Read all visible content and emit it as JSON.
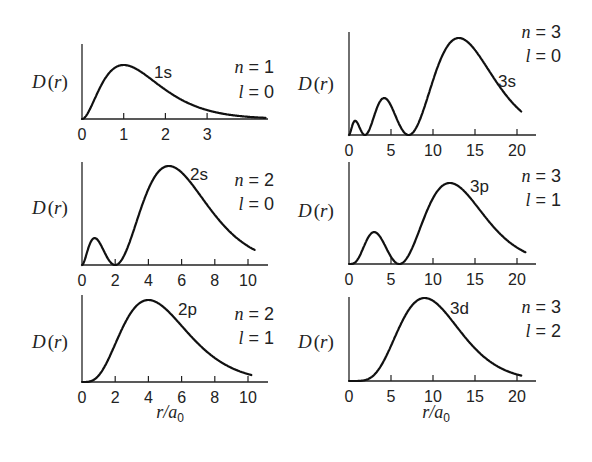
{
  "figure": {
    "ylabel": "D(r)",
    "xlabel": "r/a0"
  },
  "chart_data": [
    {
      "type": "line",
      "title": "1s",
      "quantum_numbers": {
        "n": 1,
        "l": 0
      },
      "xlabel": "",
      "ylabel": "D(r)",
      "xticks": [
        0,
        1,
        2,
        3
      ],
      "xlim": [
        0,
        4.4
      ],
      "function": "r^2 exp(-2r)",
      "peak_r": 1.0,
      "nodes": [],
      "x": [
        0,
        0.25,
        0.5,
        0.75,
        1,
        1.25,
        1.5,
        2,
        2.5,
        3,
        3.5,
        4,
        4.4
      ],
      "values": [
        0,
        0.41,
        0.74,
        0.91,
        1.0,
        0.95,
        0.84,
        0.59,
        0.34,
        0.22,
        0.11,
        0.05,
        0.02
      ]
    },
    {
      "type": "line",
      "title": "2s",
      "quantum_numbers": {
        "n": 2,
        "l": 0
      },
      "xlabel": "",
      "ylabel": "D(r)",
      "xticks": [
        0,
        2,
        4,
        6,
        8,
        10
      ],
      "xlim": [
        0,
        10.4
      ],
      "function": "r^2 (2-r)^2 exp(-r)",
      "peak_r": 5.24,
      "nodes": [
        2
      ],
      "x": [
        0,
        0.76,
        2,
        3,
        4,
        5.24,
        6,
        7,
        8,
        9,
        10.4
      ],
      "values": [
        0,
        0.26,
        0,
        0.46,
        0.84,
        1.0,
        0.93,
        0.76,
        0.54,
        0.37,
        0.16
      ]
    },
    {
      "type": "line",
      "title": "2p",
      "quantum_numbers": {
        "n": 2,
        "l": 1
      },
      "xlabel": "r/a0",
      "ylabel": "D(r)",
      "xticks": [
        0,
        2,
        4,
        6,
        8,
        10
      ],
      "xlim": [
        0,
        10.2
      ],
      "function": "r^4 exp(-r)",
      "peak_r": 4.0,
      "nodes": [],
      "x": [
        0,
        1,
        2,
        3,
        4,
        5,
        6,
        7,
        8,
        9,
        10.2
      ],
      "values": [
        0,
        0.08,
        0.52,
        0.94,
        1.0,
        0.86,
        0.64,
        0.43,
        0.26,
        0.15,
        0.07
      ]
    },
    {
      "type": "line",
      "title": "3s",
      "quantum_numbers": {
        "n": 3,
        "l": 0
      },
      "xlabel": "",
      "ylabel": "D(r)",
      "xticks": [
        0,
        5,
        10,
        15,
        20
      ],
      "xlim": [
        0,
        20.5
      ],
      "function": "r^2 (27-18r+2r^2)^2 exp(-2r/3)",
      "peak_r": 13.1,
      "nodes": [
        1.9,
        7.1
      ],
      "x": [
        0,
        0.74,
        1.9,
        4.19,
        7.1,
        10,
        13.1,
        16,
        18,
        20.5
      ],
      "values": [
        0,
        0.1,
        0,
        0.4,
        0,
        0.72,
        1.0,
        0.78,
        0.56,
        0.3
      ]
    },
    {
      "type": "line",
      "title": "3p",
      "quantum_numbers": {
        "n": 3,
        "l": 1
      },
      "xlabel": "",
      "ylabel": "D(r)",
      "xticks": [
        0,
        5,
        10,
        15,
        20
      ],
      "xlim": [
        0,
        21
      ],
      "function": "r^4 (6-r)^2 exp(-2r/3)",
      "peak_r": 12.0,
      "nodes": [
        6
      ],
      "x": [
        0,
        3,
        6,
        9,
        12,
        15,
        18,
        21
      ],
      "values": [
        0,
        0.38,
        0,
        0.76,
        1.0,
        0.77,
        0.45,
        0.16
      ]
    },
    {
      "type": "line",
      "title": "3d",
      "quantum_numbers": {
        "n": 3,
        "l": 2
      },
      "xlabel": "r/a0",
      "ylabel": "D(r)",
      "xticks": [
        0,
        5,
        10,
        15,
        20
      ],
      "xlim": [
        0,
        20.5
      ],
      "function": "r^6 exp(-2r/3)",
      "peak_r": 9.0,
      "nodes": [],
      "x": [
        0,
        3,
        6,
        9,
        12,
        15,
        18,
        20.5
      ],
      "values": [
        0,
        0.13,
        0.7,
        1.0,
        0.78,
        0.38,
        0.13,
        0.04
      ]
    }
  ],
  "panels": [
    {
      "id": "1s",
      "orbital": "1s",
      "n_text": "n = 1",
      "l_text": "l = 0",
      "ticks": [
        "0",
        "1",
        "2",
        "3"
      ]
    },
    {
      "id": "2s",
      "orbital": "2s",
      "n_text": "n = 2",
      "l_text": "l = 0",
      "ticks": [
        "0",
        "2",
        "4",
        "6",
        "8",
        "10"
      ]
    },
    {
      "id": "2p",
      "orbital": "2p",
      "n_text": "n = 2",
      "l_text": "l = 1",
      "ticks": [
        "0",
        "2",
        "4",
        "6",
        "8",
        "10"
      ]
    },
    {
      "id": "3s",
      "orbital": "3s",
      "n_text": "n = 3",
      "l_text": "l = 0",
      "ticks": [
        "0",
        "5",
        "10",
        "15",
        "20"
      ]
    },
    {
      "id": "3p",
      "orbital": "3p",
      "n_text": "n = 3",
      "l_text": "l = 1",
      "ticks": [
        "0",
        "5",
        "10",
        "15",
        "20"
      ]
    },
    {
      "id": "3d",
      "orbital": "3d",
      "n_text": "n = 3",
      "l_text": "l = 2",
      "ticks": [
        "0",
        "5",
        "10",
        "15",
        "20"
      ]
    }
  ]
}
